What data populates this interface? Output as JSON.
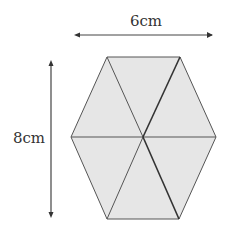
{
  "diagram": {
    "shape": "regular-hexagon",
    "fill_color": "#e6e6e6",
    "stroke_color": "#555555",
    "width_label": "6cm",
    "height_label": "8cm",
    "vertices": [
      [
        107,
        57
      ],
      [
        180,
        57
      ],
      [
        216,
        137
      ],
      [
        179,
        219
      ],
      [
        107,
        219
      ],
      [
        71,
        137
      ]
    ],
    "center": [
      143,
      137
    ],
    "triangles": 6
  }
}
